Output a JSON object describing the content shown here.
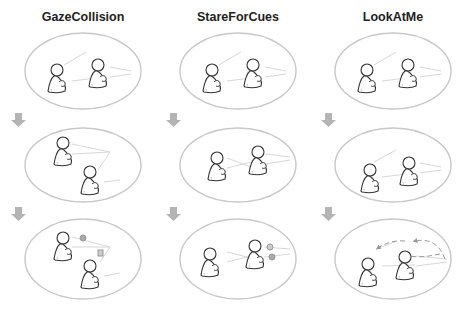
{
  "columns": [
    {
      "title": "GazeCollision",
      "x": 83
    },
    {
      "title": "StareForCues",
      "x": 238
    },
    {
      "title": "LookAtMe",
      "x": 393
    }
  ],
  "rows": [
    {
      "cy": 71,
      "ry": 38
    },
    {
      "cy": 165,
      "ry": 37
    },
    {
      "cy": 259,
      "ry": 40
    }
  ],
  "arrows": [
    {
      "x": 10,
      "y": 113
    },
    {
      "x": 10,
      "y": 207
    },
    {
      "x": 165,
      "y": 113
    },
    {
      "x": 165,
      "y": 207
    },
    {
      "x": 320,
      "y": 113
    },
    {
      "x": 320,
      "y": 207
    }
  ],
  "colors": {
    "ellipse_stroke": "#c8c8c8",
    "figure_stroke": "#333333",
    "gaze_line": "#d8d8d8",
    "arrow": "#b4b4b4",
    "marker": "#a8a8a8"
  },
  "icons": {
    "step_arrow": "down-arrow-icon",
    "character": "person-icon"
  }
}
